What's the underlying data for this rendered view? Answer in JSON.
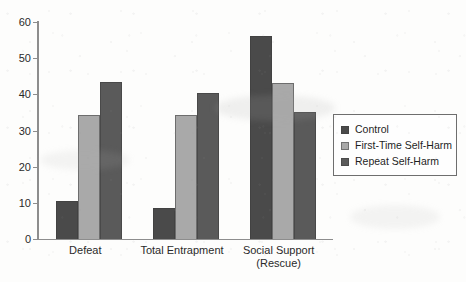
{
  "chart_data": {
    "type": "bar",
    "title": "",
    "subtitle": "",
    "xlabel": "",
    "ylabel": "",
    "ylim": [
      0,
      60
    ],
    "ytick_labels": [
      "0",
      "10",
      "20",
      "30",
      "40",
      "50",
      "60"
    ],
    "ytick_values": [
      0,
      10,
      20,
      30,
      40,
      50,
      60
    ],
    "grid": false,
    "legend_position": "right",
    "categories": [
      "Defeat",
      "Total Entrapment",
      "Social Support\n(Rescue)"
    ],
    "category_labels_plain": [
      "Defeat",
      "Total Entrapment",
      "Social Support (Rescue)"
    ],
    "series": [
      {
        "name": "Control",
        "color": "#4a4a4a",
        "values": [
          10.5,
          8.5,
          56.0
        ]
      },
      {
        "name": "First-Time Self-Harm",
        "color": "#a9a9a9",
        "values": [
          34.3,
          34.2,
          43.2
        ]
      },
      {
        "name": "Repeat Self-Harm",
        "color": "#5a5a5a",
        "values": [
          43.3,
          40.5,
          35.0
        ]
      }
    ]
  },
  "legend": {
    "items": [
      {
        "label": "Control",
        "color": "#4a4a4a"
      },
      {
        "label": "First-Time Self-Harm",
        "color": "#a9a9a9"
      },
      {
        "label": "Repeat Self-Harm",
        "color": "#5a5a5a"
      }
    ]
  }
}
